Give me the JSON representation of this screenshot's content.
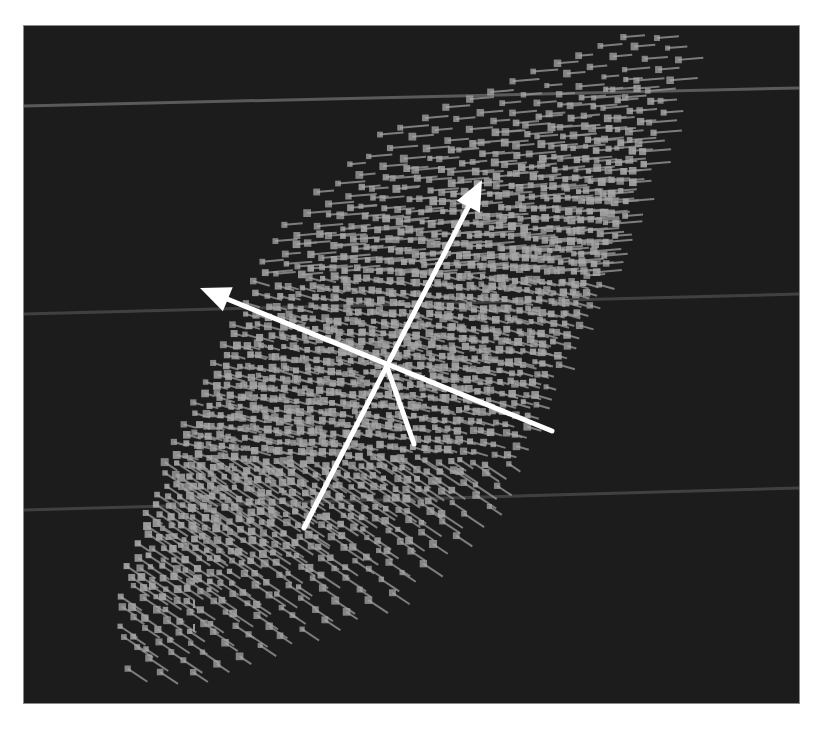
{
  "figure": {
    "background_color": "#1c1c1c",
    "page_color": "#ffffff",
    "frame": {
      "x": 24,
      "y": 26,
      "width": 775,
      "height": 677
    },
    "scanlines": [
      {
        "y1": 80,
        "y2": 62,
        "color": "#6a6a6a"
      },
      {
        "y1": 288,
        "y2": 268,
        "color": "#4a4a4a"
      },
      {
        "y1": 484,
        "y2": 462,
        "color": "#4a4a4a"
      }
    ],
    "lattice": {
      "marker_color": "#a8a8a8",
      "tail_color": "#9a9a9a",
      "description": "3D lattice of point markers with short orientation tails, viewed obliquely"
    },
    "axes": {
      "color": "#ffffff",
      "origin": [
        362,
        338
      ],
      "arrows": [
        {
          "name": "axis-up-right",
          "from": [
            280,
            502
          ],
          "to": [
            458,
            154
          ],
          "arrowhead": true
        },
        {
          "name": "axis-left",
          "from": [
            528,
            405
          ],
          "to": [
            176,
            262
          ],
          "arrowhead": true
        },
        {
          "name": "axis-down-short",
          "from": [
            362,
            338
          ],
          "to": [
            390,
            418
          ],
          "arrowhead": false
        }
      ]
    },
    "dashed_marker": {
      "x": 170,
      "y1": 550,
      "y2": 620,
      "color": "#9a9a9a"
    }
  }
}
